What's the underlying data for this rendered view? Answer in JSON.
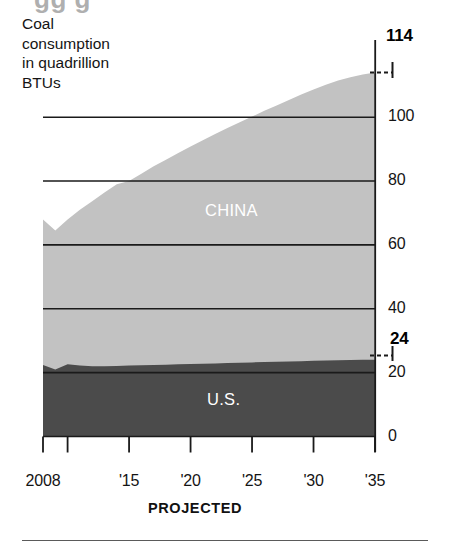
{
  "headline_remnant": "gg g",
  "caption": "Coal\nconsumption\nin quadrillion\nBTUs",
  "footnote": "PROJECTED",
  "labels": {
    "china": "CHINA",
    "us": "U.S."
  },
  "callouts": {
    "top_total": "114",
    "us_end": "24"
  },
  "colors": {
    "china_area": "#c2c2c2",
    "us_area": "#4b4b4b",
    "gridline": "#1a1a1a",
    "axis": "#1a1a1a",
    "series_label": "#ffffff",
    "background": "#ffffff"
  },
  "chart_data": {
    "type": "area",
    "title": "Coal consumption in quadrillion BTUs",
    "subtitle": "",
    "xlabel": "",
    "ylabel": "quadrillion BTUs",
    "stacked": true,
    "grid": true,
    "legend": "inline",
    "xlim": [
      2008,
      2035
    ],
    "ylim": [
      0,
      114
    ],
    "yticks": [
      0,
      20,
      40,
      60,
      80,
      100
    ],
    "ytick_labels": [
      "0",
      "20",
      "40",
      "60",
      "80",
      "100"
    ],
    "xticks": [
      2008,
      2010,
      2015,
      2020,
      2025,
      2030,
      2035
    ],
    "xtick_labels": [
      "2008",
      "",
      "'15",
      "'20",
      "'25",
      "'30",
      "'35"
    ],
    "annotations": [
      {
        "text": "114",
        "value": 114,
        "at_x": 2035,
        "note": "total at end of projection"
      },
      {
        "text": "24",
        "value": 24,
        "at_x": 2035,
        "note": "U.S. at end of projection"
      }
    ],
    "x": [
      2008,
      2009,
      2010,
      2011,
      2012,
      2013,
      2014,
      2015,
      2016,
      2017,
      2018,
      2019,
      2020,
      2021,
      2022,
      2023,
      2024,
      2025,
      2026,
      2027,
      2028,
      2029,
      2030,
      2031,
      2032,
      2033,
      2034,
      2035
    ],
    "series": [
      {
        "name": "U.S.",
        "color": "#4b4b4b",
        "values": [
          22.4,
          21.0,
          22.6,
          22.2,
          22.0,
          22.0,
          22.1,
          22.2,
          22.3,
          22.4,
          22.5,
          22.6,
          22.7,
          22.8,
          22.9,
          23.0,
          23.1,
          23.2,
          23.3,
          23.4,
          23.5,
          23.6,
          23.7,
          23.8,
          23.9,
          23.95,
          24.0,
          24.0
        ]
      },
      {
        "name": "CHINA",
        "color": "#c2c2c2",
        "values": [
          45.6,
          43.5,
          45.4,
          48.8,
          51.7,
          54.4,
          56.9,
          57.8,
          60.0,
          62.2,
          64.2,
          66.2,
          68.1,
          70.0,
          71.8,
          73.6,
          75.3,
          77.0,
          78.7,
          80.3,
          81.9,
          83.5,
          85.0,
          86.4,
          87.6,
          88.6,
          89.4,
          90.0
        ]
      }
    ],
    "totals": [
      68.0,
      64.5,
      68.0,
      71.0,
      73.7,
      76.4,
      79.0,
      80.0,
      82.3,
      84.6,
      86.7,
      88.8,
      90.8,
      92.8,
      94.7,
      96.6,
      98.4,
      100.2,
      102.0,
      103.7,
      105.4,
      107.1,
      108.7,
      110.2,
      111.5,
      112.55,
      113.4,
      114.0
    ]
  }
}
